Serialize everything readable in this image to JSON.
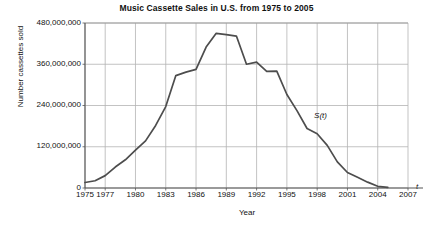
{
  "chart_data": {
    "type": "line",
    "title": "Music Cassette Sales in U.S. from 1975 to 2005",
    "xlabel": "Year",
    "ylabel": "Number cassettes sold",
    "axis_variable_label": "t",
    "series_label": "S(t)",
    "xlim": [
      1975,
      2007
    ],
    "ylim": [
      0,
      480000000
    ],
    "grid": true,
    "legend_position": "none",
    "ytick_labels": [
      "0",
      "120,000,000",
      "240,000,000",
      "360,000,000",
      "480,000,000"
    ],
    "ytick_values": [
      0,
      120000000,
      240000000,
      360000000,
      480000000
    ],
    "xtick_labels": [
      "1975",
      "1977",
      "1980",
      "1983",
      "1986",
      "1989",
      "1992",
      "1995",
      "1998",
      "2001",
      "2004",
      "2007"
    ],
    "xtick_values": [
      1975,
      1977,
      1980,
      1983,
      1986,
      1989,
      1992,
      1995,
      1998,
      2001,
      2004,
      2007
    ],
    "series": [
      {
        "name": "S(t)",
        "x": [
          1975,
          1976,
          1977,
          1978,
          1979,
          1980,
          1981,
          1982,
          1983,
          1984,
          1985,
          1986,
          1987,
          1988,
          1989,
          1990,
          1991,
          1992,
          1993,
          1994,
          1995,
          1996,
          1997,
          1998,
          1999,
          2000,
          2001,
          2002,
          2003,
          2004,
          2005
        ],
        "values": [
          16000000,
          21000000,
          36000000,
          61000000,
          82000000,
          110000000,
          137000000,
          182000000,
          237000000,
          327000000,
          337000000,
          345000000,
          410000000,
          450000000,
          446000000,
          442000000,
          360000000,
          366000000,
          339000000,
          340000000,
          272000000,
          225000000,
          173000000,
          158000000,
          124000000,
          76000000,
          45000000,
          31000000,
          17000000,
          5000000,
          2000000
        ]
      }
    ]
  }
}
